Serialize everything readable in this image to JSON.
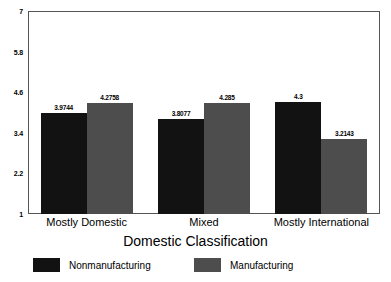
{
  "chart_data": {
    "type": "bar",
    "title": "",
    "subtitle": "",
    "xlabel": "Domestic Classification",
    "ylabel": "",
    "categories": [
      "Mostly Domestic",
      "Mixed",
      "Mostly International"
    ],
    "series": [
      {
        "name": "Nonmanufacturing",
        "color": "#121212",
        "values": [
          3.9744,
          3.8077,
          4.3
        ],
        "labels": [
          "3.9744",
          "3.8077",
          "4.3"
        ]
      },
      {
        "name": "Manufacturing",
        "color": "#4d4d4d",
        "values": [
          4.2758,
          4.285,
          3.2143
        ],
        "labels": [
          "4.2758",
          "4.285",
          "3.2143"
        ]
      }
    ],
    "ylim": [
      1,
      7
    ],
    "yticks": [
      1,
      2.2,
      3.4,
      4.6,
      5.8,
      7
    ],
    "ytick_labels": [
      "1",
      "2.2",
      "3.4",
      "4.6",
      "5.8",
      "7"
    ],
    "grid": false,
    "legend_position": "bottom"
  },
  "axis": {
    "y_labels": [
      "7",
      "5.8",
      "4.6",
      "3.4",
      "2.2",
      "1"
    ],
    "x_title": "Domestic Classification"
  },
  "legend": {
    "items": [
      {
        "label": "Nonmanufacturing",
        "color": "#121212"
      },
      {
        "label": "Manufacturing",
        "color": "#4d4d4d"
      }
    ]
  }
}
